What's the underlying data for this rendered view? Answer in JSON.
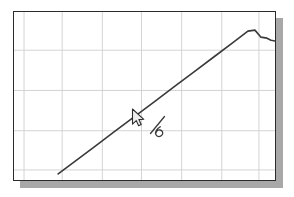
{
  "window": {
    "title": "Plot Window",
    "background_color": "#ffffff"
  },
  "plot": {
    "name": "line-plot",
    "frame": {
      "x": 13,
      "y": 11,
      "width": 263,
      "height": 170,
      "border_color": "#2b2b2b",
      "background_color": "#ffffff"
    },
    "shadow": {
      "color": "#a8a8a8",
      "offset_x": 7,
      "offset_y": 7
    },
    "grid": {
      "visible": true,
      "color": "#cfcfcf",
      "vertical_x": [
        10,
        48,
        88,
        127,
        167,
        207,
        244
      ],
      "horizontal_y": [
        38,
        78,
        118,
        157
      ]
    }
  },
  "chart_data": {
    "type": "line",
    "title": "",
    "subtitle": "",
    "xlabel": "",
    "ylabel": "",
    "grid": true,
    "legend": "none",
    "xlim": [
      0,
      263
    ],
    "ylim": [
      0,
      170
    ],
    "axis_ticks": {
      "x": [],
      "y": []
    },
    "series": [
      {
        "name": "curve",
        "color": "#3a3a3a",
        "line_width": 1.6,
        "points": [
          [
            44,
            161
          ],
          [
            60,
            149
          ],
          [
            80,
            134
          ],
          [
            100,
            119
          ],
          [
            120,
            104
          ],
          [
            140,
            89
          ],
          [
            160,
            74
          ],
          [
            180,
            59
          ],
          [
            200,
            44
          ],
          [
            220,
            29
          ],
          [
            233,
            19
          ],
          [
            240,
            18
          ],
          [
            246,
            25
          ],
          [
            252,
            26
          ],
          [
            256,
            28
          ],
          [
            261,
            29
          ],
          [
            266,
            28
          ],
          [
            270,
            29
          ],
          [
            274,
            29
          ]
        ]
      }
    ],
    "annotations": [
      {
        "name": "handwritten-six",
        "text": "6",
        "x": 152,
        "y": 126,
        "rotation": -35,
        "color": "#3a3a3a"
      }
    ]
  },
  "cursor": {
    "name": "mouse-pointer",
    "shape": "arrow",
    "x": 131,
    "y": 108,
    "color": "#f2f2f2",
    "outline_color": "#2b2b2b"
  }
}
